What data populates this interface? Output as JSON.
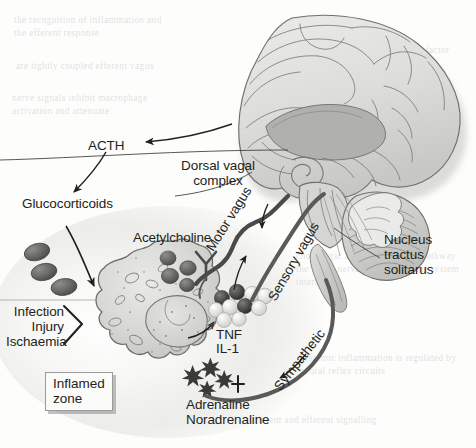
{
  "figure": {
    "type": "anatomical-schematic",
    "style": "grayscale scanned textbook illustration",
    "colors": {
      "background": "#fdfdfc",
      "ink": "#231f20",
      "brain_fill_light": "#e3e3e2",
      "brain_fill_mid": "#c9c9c8",
      "brain_fill_dark": "#a9a9a8",
      "outline": "#6f6f6e",
      "nerve_dark": "#4b4b4a",
      "nerve_mid": "#6d6d6c",
      "cell_fill": "#d8d8d6",
      "granule_dark": "#3f3f3e",
      "granule_light": "#efefed",
      "zone_glow": "#f3f3f1",
      "box_border": "#9b9b9b"
    }
  },
  "labels": {
    "acth": "ACTH",
    "glucocorticoids": "Glucocorticoids",
    "dorsal_vagal_complex": "Dorsal vagal\ncomplex",
    "acetylcholine": "Acetylcholine",
    "motor_vagus": "Motor vagus",
    "sensory_vagus": "Sensory vagus",
    "sympathetic": "Sympathetic",
    "nucleus_tractus_solitarus": "Nucleus\ntractus\nsolitarus",
    "stimuli": "Infection\nInjury\nIschaemia",
    "tnf": "TNF",
    "il1": "IL-1",
    "adrenaline": "Adrenaline\nNoradrenaline",
    "inflamed_zone": "Inflamed\nzone"
  },
  "structures": [
    {
      "name": "cerebrum-sagittal",
      "description": "Mid-sagittal section of the cerebral hemisphere with gyri and sulci"
    },
    {
      "name": "corpus-callosum",
      "description": "Dark crescent body above the brainstem"
    },
    {
      "name": "cerebellum",
      "description": "Striated foliated mass posterior-inferior to the cerebrum"
    },
    {
      "name": "brainstem",
      "description": "Medulla and pons continuing into the spinal cord wedge"
    },
    {
      "name": "spinal-cord-wedge",
      "description": "Tapering grey band descending from the brainstem"
    },
    {
      "name": "macrophage",
      "description": "Large irregular immune cell with nucleus and cytoplasmic vesicles"
    },
    {
      "name": "macrophage-nucleus",
      "description": "Oval nucleus inside the macrophage"
    },
    {
      "name": "nerve-terminal",
      "description": "Y-shaped cholinergic nerve ending adjacent to the macrophage"
    },
    {
      "name": "glucocorticoid-granules",
      "count": 3,
      "description": "Three dark ovals representing circulating glucocorticoids"
    },
    {
      "name": "acetylcholine-granules",
      "count": 4,
      "description": "Dark granules released from the vagal nerve terminal"
    },
    {
      "name": "cytokine-spheres",
      "count": 9,
      "description": "Mixed dark and light spheres representing TNF and IL-1"
    },
    {
      "name": "catecholamine-stars",
      "count": 4,
      "description": "Burst shapes representing adrenaline and noradrenaline"
    },
    {
      "name": "inflamed-zone-glow",
      "description": "Soft radial halo marking the inflamed tissue zone"
    }
  ],
  "arrows": [
    {
      "name": "brain-to-acth",
      "from": "brain",
      "to": "ACTH",
      "direction": "leftward-sweep"
    },
    {
      "name": "acth-to-glucocorticoids",
      "from": "ACTH",
      "to": "Glucocorticoids",
      "direction": "downward-left"
    },
    {
      "name": "glucocorticoids-to-macrophage",
      "from": "Glucocorticoids",
      "to": "macrophage",
      "direction": "down-right"
    },
    {
      "name": "stimuli-to-macrophage",
      "from": "Infection / Injury / Ischaemia",
      "to": "macrophage",
      "direction": "right-chevron"
    },
    {
      "name": "motor-vagus-efferent",
      "from": "dorsal vagal complex",
      "to": "nerve terminal",
      "direction": "descending"
    },
    {
      "name": "sensory-vagus-afferent",
      "from": "cytokines",
      "to": "nucleus tractus solitarus",
      "direction": "ascending"
    },
    {
      "name": "sympathetic-efferent",
      "from": "spinal cord",
      "to": "inflamed zone",
      "direction": "descending"
    },
    {
      "name": "cytokine-release",
      "from": "macrophage",
      "to": "TNF / IL-1",
      "direction": "short-curve-right"
    }
  ],
  "ghost_text": {
    "note": "faint show-through of text printed on the reverse of the page",
    "lines": [
      "the recognition of inflammation",
      "and the efferent response to it",
      "are tightly coupled",
      "efferent vagus nerve signals",
      "inhibit macrophage activation",
      "and attenuate the release of",
      "tumour necrosis factor",
      "in the inflamed zone"
    ]
  }
}
